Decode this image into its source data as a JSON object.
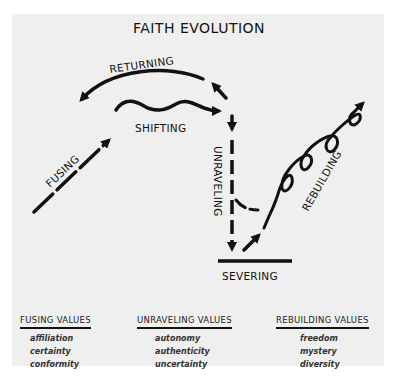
{
  "title": "FAITH EVOLUTION",
  "colors": {
    "panel_bg": "#efefef",
    "ink": "#111111",
    "page_bg": "#ffffff"
  },
  "stages": {
    "fusing": "FUSING",
    "shifting": "SHIFTING",
    "returning": "RETURNING",
    "unraveling": "UNRAVELING",
    "severing": "SEVERING",
    "rebuilding": "REBUILDING"
  },
  "values": [
    {
      "heading": "FUSING VALUES",
      "items": [
        "affiliation",
        "certainty",
        "conformity"
      ]
    },
    {
      "heading": "UNRAVELING VALUES",
      "items": [
        "autonomy",
        "authenticity",
        "uncertainty"
      ]
    },
    {
      "heading": "REBUILDING VALUES",
      "items": [
        "freedom",
        "mystery",
        "diversity"
      ]
    }
  ]
}
